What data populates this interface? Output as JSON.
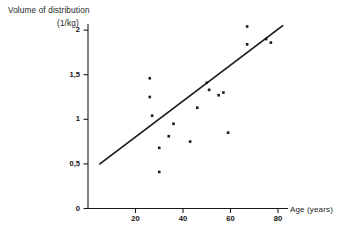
{
  "chart_data": {
    "type": "scatter",
    "title": "",
    "ylabel": "Volume of distribution",
    "ylabel_units": "(1/kg)",
    "xlabel": "Age (years)",
    "xlim": [
      0,
      90
    ],
    "ylim": [
      0,
      2.15
    ],
    "grid": false,
    "legend": null,
    "xticks": [
      20,
      40,
      60,
      80
    ],
    "xtick_labels": [
      "20",
      "40",
      "60",
      "80"
    ],
    "yticks": [
      0,
      0.5,
      1,
      1.5,
      2
    ],
    "ytick_labels": [
      "0",
      "0,5",
      "1",
      "1,5",
      "2"
    ],
    "decimal_separator": ",",
    "marker": "square-dot",
    "marker_color": "#1a1a1a",
    "line_color": "#1a1a1a",
    "points": [
      {
        "x": 26,
        "y": 1.46
      },
      {
        "x": 26,
        "y": 1.25
      },
      {
        "x": 27,
        "y": 1.04
      },
      {
        "x": 30,
        "y": 0.68
      },
      {
        "x": 30,
        "y": 0.41
      },
      {
        "x": 36,
        "y": 0.95
      },
      {
        "x": 34,
        "y": 0.81
      },
      {
        "x": 43,
        "y": 0.75
      },
      {
        "x": 50,
        "y": 1.41
      },
      {
        "x": 51,
        "y": 1.33
      },
      {
        "x": 55,
        "y": 1.27
      },
      {
        "x": 57,
        "y": 1.3
      },
      {
        "x": 46,
        "y": 1.13
      },
      {
        "x": 59,
        "y": 0.85
      },
      {
        "x": 67,
        "y": 2.04
      },
      {
        "x": 67,
        "y": 1.84
      },
      {
        "x": 75,
        "y": 1.9
      },
      {
        "x": 77,
        "y": 1.86
      }
    ],
    "regression_line": {
      "x_start": 5,
      "y_start": 0.5,
      "x_end": 82,
      "y_end": 2.05
    }
  },
  "axes": {
    "y_axis_name": "volume-of-distribution-axis",
    "x_axis_name": "age-axis"
  }
}
